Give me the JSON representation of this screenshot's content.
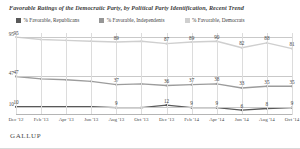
{
  "chart_title": "Favorable Ratings of the Democratic Party, by Political Party Identification, Recent Trend",
  "legend": {
    "items": [
      {
        "label": "% Favorable, Republicans",
        "color": "#595959"
      },
      {
        "label": "% Favorable, Independents",
        "color": "#969696"
      },
      {
        "label": "% Favorable, Democrats",
        "color": "#cfcfcf"
      }
    ]
  },
  "footer": {
    "brand": "GALLUP"
  },
  "chart_data": {
    "type": "line",
    "title": "Favorable Ratings of the Democratic Party, by Political Party Identification, Recent Trend",
    "xlabel": "",
    "ylabel": "",
    "ylim": [
      0,
      100
    ],
    "grid": true,
    "legend_position": "top-left",
    "categories": [
      "Dec '12",
      "Feb '13",
      "Apr '13",
      "Jun '13",
      "Aug '13",
      "Oct '13",
      "Dec '13",
      "Feb '14",
      "Apr '14",
      "Jun '14",
      "Aug '14",
      "Oct '14"
    ],
    "ytick_values": [
      95,
      47,
      10
    ],
    "ytick_labels": [
      "95",
      "47",
      "10"
    ],
    "series": [
      {
        "name": "% Favorable, Democrats",
        "color": "#cfcfcf",
        "values": [
          95,
          92,
          91,
          90,
          89,
          90,
          87,
          89,
          90,
          82,
          88,
          81
        ],
        "point_labels": [
          "95",
          "",
          "",
          "",
          "89",
          "",
          "87",
          "89",
          "90",
          "82",
          "88",
          "81"
        ]
      },
      {
        "name": "% Favorable, Independents",
        "color": "#9c9c9c",
        "values": [
          47,
          44,
          43,
          41,
          37,
          38,
          36,
          37,
          38,
          33,
          35,
          35
        ],
        "point_labels": [
          "47",
          "",
          "",
          "",
          "37",
          "",
          "36",
          "37",
          "38",
          "33",
          "35",
          "35"
        ]
      },
      {
        "name": "% Favorable, Republicans",
        "color": "#595959",
        "values": [
          10,
          10,
          10,
          10,
          9,
          9,
          12,
          9,
          9,
          6,
          8,
          9
        ],
        "point_labels": [
          "10",
          "",
          "",
          "",
          "9",
          "",
          "12",
          "9",
          "9",
          "6",
          "8",
          "9"
        ]
      }
    ]
  }
}
